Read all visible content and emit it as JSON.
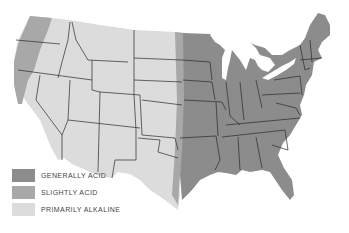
{
  "map": {
    "subject": "Soil acidity of the contiguous United States",
    "colors": {
      "generally_acid": "#8c8c8c",
      "slightly_acid": "#a8a8a8",
      "primarily_alkaline": "#dcdcdc",
      "border": "#2a2a2a",
      "water": "#ffffff"
    },
    "legend": {
      "items": [
        {
          "label": "GENERALLY ACID",
          "color": "#8c8c8c"
        },
        {
          "label": "SLIGHTLY ACID",
          "color": "#a8a8a8"
        },
        {
          "label": "PRIMARILY ALKALINE",
          "color": "#dcdcdc"
        }
      ]
    }
  }
}
